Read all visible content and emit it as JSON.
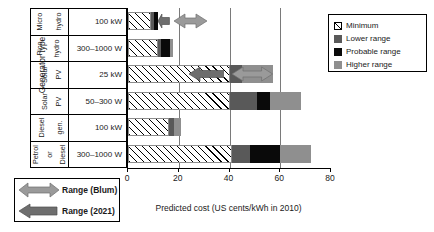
{
  "axis": {
    "y_caption": "Generator type",
    "x_caption": "Predicted cost (US cents/kWh in 2010)",
    "x_ticks": [
      0,
      20,
      40,
      60,
      80
    ]
  },
  "rows": [
    {
      "type_line1": "Micro",
      "type_line2": "hydro",
      "size": "100 kW"
    },
    {
      "type_line1": "Pico",
      "type_line2": "hydro",
      "size": "300–1000 W"
    },
    {
      "type_line1": "Solar",
      "type_line2": "PV",
      "size": "25 kW"
    },
    {
      "type_line1": "Solar",
      "type_line2": "PV",
      "size": "50–300 W"
    },
    {
      "type_line1": "Diesel",
      "type_line2": "gen.",
      "size": "100 kW"
    },
    {
      "type_line1": "Petrol",
      "type_line2": "or",
      "type_line3": "Diesel",
      "size": "300–1000 W"
    }
  ],
  "legend": {
    "items": [
      {
        "label": "Minimum",
        "swatch": "hatch",
        "color": "#ffffff"
      },
      {
        "label": "Lower range",
        "swatch": "solid",
        "color": "#595959"
      },
      {
        "label": "Probable range",
        "swatch": "solid",
        "color": "#0a0a0a"
      },
      {
        "label": "Higher range",
        "swatch": "solid",
        "color": "#8f8f8f"
      }
    ]
  },
  "arrow_legend": {
    "items": [
      {
        "label": "Range (Blum)",
        "icon": "double-arrow-icon",
        "color": "#9a9a9a"
      },
      {
        "label": "Range (2021)",
        "icon": "left-arrow-icon",
        "color": "#6e6e6e"
      }
    ]
  },
  "chart_data": {
    "type": "bar",
    "orientation": "horizontal",
    "stacked": true,
    "title": "",
    "xlabel": "Predicted cost (US cents/kWh in 2010)",
    "ylabel": "Generator type",
    "xlim": [
      0,
      80
    ],
    "xticks": [
      0,
      20,
      40,
      60,
      80
    ],
    "grid": "vertical gridlines at 20, 40, 60",
    "legend_position": "top-right",
    "categories": [
      "Micro hydro 100 kW",
      "Pico hydro 300-1000 W",
      "Solar PV 25 kW",
      "Solar PV 50-300 W",
      "Diesel gen. 100 kW",
      "Petrol or Diesel 300-1000 W"
    ],
    "series": [
      {
        "name": "Minimum",
        "color": "#ffffff",
        "values": [
          9.2,
          12.0,
          40.0,
          40.0,
          16.0,
          41.0
        ]
      },
      {
        "name": "Lower range",
        "color": "#595959",
        "values": [
          1.2,
          1.2,
          5.0,
          11.0,
          2.0,
          7.0
        ]
      },
      {
        "name": "Probable range",
        "color": "#0a0a0a",
        "values": [
          1.6,
          3.2,
          0.0,
          5.0,
          0.0,
          12.0
        ]
      },
      {
        "name": "Higher range",
        "color": "#8f8f8f",
        "values": [
          0.0,
          1.2,
          12.0,
          12.0,
          3.0,
          12.0
        ]
      }
    ],
    "cumulative_ends": [
      {
        "category": "Micro hydro 100 kW",
        "minimum": 9.2,
        "lower": 10.4,
        "probable": 12.0,
        "higher": 12.0
      },
      {
        "category": "Pico hydro 300-1000 W",
        "minimum": 12.0,
        "lower": 13.2,
        "probable": 16.4,
        "higher": 17.6
      },
      {
        "category": "Solar PV 25 kW",
        "minimum": 40.0,
        "lower": 45.0,
        "probable": 45.0,
        "higher": 57.0
      },
      {
        "category": "Solar PV 50-300 W",
        "minimum": 40.0,
        "lower": 51.0,
        "probable": 56.0,
        "higher": 68.0
      },
      {
        "category": "Diesel gen. 100 kW",
        "minimum": 16.0,
        "lower": 18.0,
        "probable": 18.0,
        "higher": 21.0
      },
      {
        "category": "Petrol or Diesel 300-1000 W",
        "minimum": 41.0,
        "lower": 48.0,
        "probable": 60.0,
        "higher": 72.0
      }
    ],
    "annotations": [
      {
        "row": "Micro hydro 100 kW",
        "type": "Range (2021)",
        "style": "left-arrow",
        "from": 12.0,
        "to": 16.5
      },
      {
        "row": "Micro hydro 100 kW",
        "type": "Range (Blum)",
        "style": "double-arrow",
        "from": 18.0,
        "to": 31.0
      },
      {
        "row": "Solar PV 25 kW",
        "type": "Range (2021)",
        "style": "left-arrow",
        "from": 24.0,
        "to": 38.0
      },
      {
        "row": "Solar PV 25 kW",
        "type": "Range (Blum)",
        "style": "double-arrow",
        "from": 41.0,
        "to": 57.0
      }
    ]
  }
}
